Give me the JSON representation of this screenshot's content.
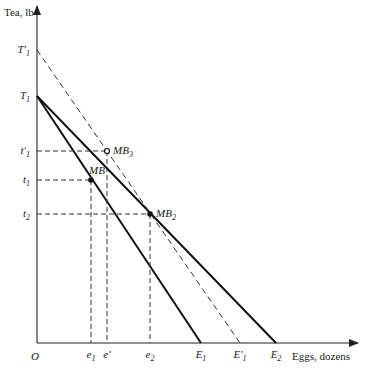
{
  "diagram": {
    "y_axis_label": "Tea, lb",
    "x_axis_label": "Eggs, dozens",
    "origin_label": "O",
    "y_ticks": [
      {
        "key": "T1p",
        "main": "T",
        "prime": "′",
        "sub": "1"
      },
      {
        "key": "T1",
        "main": "T",
        "prime": "",
        "sub": "1"
      },
      {
        "key": "t1p",
        "main": "t",
        "prime": "′",
        "sub": "1"
      },
      {
        "key": "t1",
        "main": "t",
        "prime": "",
        "sub": "1"
      },
      {
        "key": "t2",
        "main": "t",
        "prime": "",
        "sub": "2"
      }
    ],
    "x_ticks": [
      {
        "key": "e1",
        "main": "e",
        "prime": "",
        "sub": "1"
      },
      {
        "key": "ep",
        "main": "e",
        "prime": "′",
        "sub": ""
      },
      {
        "key": "e2",
        "main": "e",
        "prime": "",
        "sub": "2"
      },
      {
        "key": "E1",
        "main": "E",
        "prime": "",
        "sub": "1"
      },
      {
        "key": "E1p",
        "main": "E",
        "prime": "′",
        "sub": "1"
      },
      {
        "key": "E2",
        "main": "E",
        "prime": "",
        "sub": "2"
      }
    ],
    "points": [
      {
        "key": "MB3",
        "main": "MB",
        "sub": "3"
      },
      {
        "key": "MB",
        "main": "MB",
        "sub": ""
      },
      {
        "key": "MB2",
        "main": "MB",
        "sub": "2"
      }
    ],
    "lines": [
      {
        "name": "budget-line-T1-E1",
        "from": "T1",
        "to": "E1",
        "style": "solid"
      },
      {
        "name": "budget-line-T1-E2",
        "from": "T1",
        "to": "E2",
        "style": "solid"
      },
      {
        "name": "budget-line-T1p-E1p",
        "from": "T1p",
        "to": "E1p",
        "style": "dashed"
      }
    ]
  }
}
